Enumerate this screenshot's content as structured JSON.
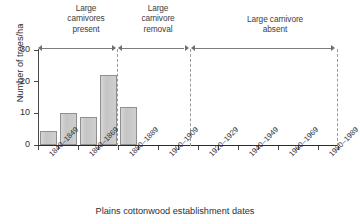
{
  "chart_data": {
    "type": "bar",
    "title": "",
    "xlabel": "Plains cottonwood establishment dates",
    "ylabel": "Number of trees/ha",
    "ylim": [
      0,
      30
    ],
    "yticks": [
      0,
      10,
      20,
      30
    ],
    "ytick_labels": [
      "0",
      "10",
      "20",
      "30"
    ],
    "grid": false,
    "legend": "none",
    "categories": [
      "1840-1849",
      "1850-1859",
      "1860-1869",
      "1870-1879",
      "1880-1889",
      "1890-1899",
      "1900-1909",
      "1910-1919",
      "1920-1929",
      "1930-1939",
      "1940-1949",
      "1950-1959",
      "1960-1969",
      "1970-1979",
      "1980-1989"
    ],
    "xtick_labels": [
      "1840–1849",
      "1860–1869",
      "1880–1889",
      "1900–1909",
      "1920–1929",
      "1940–1949",
      "1960–1969",
      "1980–1989"
    ],
    "values": [
      4.5,
      10,
      9,
      22,
      12,
      0,
      0,
      0,
      0,
      0,
      0,
      0,
      0,
      0,
      0
    ],
    "annotations": [
      {
        "label": "Large\ncarnivores\npresent",
        "span_start_category": "1840-1849",
        "span_end_category": "1870-1879"
      },
      {
        "label": "Large\ncarnivore\nremoval",
        "span_start_category": "1880-1889",
        "span_end_category": "1910-1919"
      },
      {
        "label": "Large carnivore\nabsent",
        "span_start_category": "1920-1929",
        "span_end_category": "1980-1989"
      }
    ],
    "divider_positions_after_category": [
      "1870-1879",
      "1910-1919",
      "1980-1989"
    ],
    "colors": {
      "bar_fill": "#cccccc",
      "bar_edge": "#8f8f8f",
      "axis": "#2b2b2b",
      "divider": "#9a9a9a",
      "arrow": "#6f6f6f",
      "text": "#2f2f2f",
      "background": "#ffffff"
    }
  }
}
